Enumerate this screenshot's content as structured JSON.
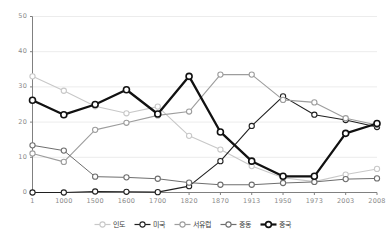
{
  "chart_data": {
    "type": "line",
    "title": "",
    "subtitle": "",
    "xlabel": "",
    "ylabel": "",
    "categories": [
      "1",
      "1000",
      "1500",
      "1600",
      "1700",
      "1820",
      "1870",
      "1913",
      "1950",
      "1973",
      "2003",
      "2008"
    ],
    "ylim": [
      0,
      50
    ],
    "xlim_index": [
      0,
      11
    ],
    "yticks": [
      "0",
      "10",
      "20",
      "30",
      "40",
      "50"
    ],
    "ytick_values": [
      0,
      10,
      20,
      30,
      40,
      50
    ],
    "grid": "horizontal-only",
    "legend_position": "bottom-center",
    "series": [
      {
        "name": "인도",
        "color": "#c8c8c8",
        "marker": "open-circle",
        "line_width": 1.1,
        "values": [
          33.0,
          28.9,
          24.5,
          22.5,
          24.4,
          16.1,
          12.2,
          7.5,
          4.2,
          3.1,
          5.1,
          6.7
        ]
      },
      {
        "name": "미국",
        "color": "#202020",
        "marker": "open-circle",
        "line_width": 1.1,
        "values": [
          0.0,
          0.0,
          0.3,
          0.2,
          0.1,
          1.8,
          8.9,
          18.9,
          27.3,
          22.1,
          20.6,
          18.6
        ]
      },
      {
        "name": "서유럽",
        "color": "#9d9d9d",
        "marker": "open-circle",
        "line_width": 1.1,
        "values": [
          11.1,
          8.7,
          17.8,
          19.8,
          21.9,
          23.0,
          33.5,
          33.5,
          26.3,
          25.6,
          21.1,
          19.2
        ]
      },
      {
        "name": "중동",
        "color": "#6e6e6e",
        "marker": "open-circle",
        "line_width": 1.0,
        "values": [
          13.4,
          11.9,
          4.5,
          4.3,
          3.9,
          2.8,
          2.2,
          2.2,
          2.7,
          3.0,
          3.8,
          4.0
        ]
      },
      {
        "name": "중국",
        "color": "#111111",
        "marker": "open-circle",
        "line_width": 2.3,
        "values": [
          26.2,
          22.1,
          25.0,
          29.2,
          22.3,
          33.0,
          17.2,
          8.9,
          4.6,
          4.6,
          16.8,
          19.6
        ]
      }
    ]
  },
  "axis": {
    "axis_color": "#808080",
    "grid_color": "#ececec",
    "tick_text_color": "#8a8a8a"
  },
  "legend": {
    "items": [
      {
        "label": "인도"
      },
      {
        "label": "미국"
      },
      {
        "label": "서유럽"
      },
      {
        "label": "중동"
      },
      {
        "label": "중국"
      }
    ]
  }
}
